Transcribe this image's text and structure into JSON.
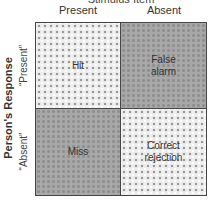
{
  "diagram": {
    "title": "Stimulus Item",
    "column_labels": [
      "Present",
      "Absent"
    ],
    "row_axis_label": "Person's Response",
    "row_labels": [
      "“Present”",
      "“Absent”"
    ],
    "cells": [
      {
        "label": "Hit",
        "pattern": "light"
      },
      {
        "label": "False alarm",
        "pattern": "dark"
      },
      {
        "label": "Miss",
        "pattern": "dark"
      },
      {
        "label": "Correct rejection",
        "pattern": "light"
      }
    ]
  }
}
